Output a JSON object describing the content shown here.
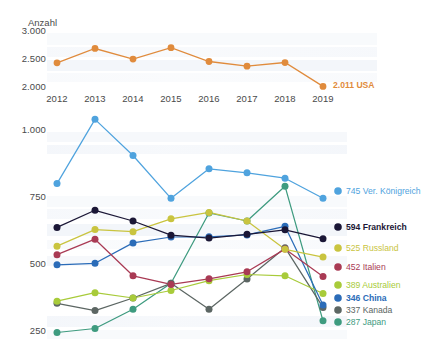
{
  "chart_data": {
    "type": "line",
    "title": "",
    "xlabel": "",
    "ylabel": "Anzahl",
    "x": [
      "2012",
      "2013",
      "2014",
      "2015",
      "2016",
      "2017",
      "2018",
      "2019"
    ],
    "panels": [
      {
        "name": "usa-panel",
        "ylim": [
          2000,
          3000
        ],
        "yticks": [
          2000,
          2500,
          3000
        ],
        "ytick_labels": [
          "2.000",
          "2.500",
          "3.000"
        ],
        "grid": false,
        "series": [
          {
            "name": "USA",
            "color": "#E08B3C",
            "values": [
              2432,
              2688,
              2498,
              2702,
              2455,
              2372,
              2437,
              2011
            ],
            "end_label": "2.011 USA",
            "end_value": 2011,
            "bold": false
          }
        ]
      },
      {
        "name": "countries-panel",
        "ylim": [
          230,
          1075
        ],
        "yticks": [
          250,
          500,
          750,
          1000
        ],
        "ytick_labels": [
          "250",
          "500",
          "750",
          "1.000"
        ],
        "grid": false,
        "series": [
          {
            "name": "Ver. Königreich",
            "color": "#4FA3DE",
            "values": [
              800,
              1040,
              905,
              745,
              855,
              840,
              820,
              745
            ],
            "end_label": "745 Ver. Königreich",
            "end_value": 745,
            "bold": false
          },
          {
            "name": "Frankreich",
            "color": "#1B1736",
            "values": [
              636,
              700,
              660,
              607,
              596,
              610,
              627,
              594
            ],
            "end_label": "594 Frankreich",
            "end_value": 594,
            "bold": true
          },
          {
            "name": "Russland",
            "color": "#C9C43F",
            "values": [
              566,
              628,
              620,
              668,
              692,
              660,
              554,
              525
            ],
            "end_label": "525 Russland",
            "end_value": 525,
            "bold": false
          },
          {
            "name": "Italien",
            "color": "#A93A54",
            "values": [
              534,
              592,
              455,
              423,
              444,
              470,
              555,
              452
            ],
            "end_label": "452 Italien",
            "end_value": 452,
            "bold": false
          },
          {
            "name": "Australien",
            "color": "#A8CB3A",
            "values": [
              360,
              392,
              372,
              400,
              437,
              460,
              455,
              389
            ],
            "end_label": "389 Australien",
            "end_value": 389,
            "bold": false
          },
          {
            "name": "China",
            "color": "#2B6CB8",
            "values": [
              496,
              502,
              578,
              600,
              601,
              608,
              640,
              346
            ],
            "end_label": "346 China",
            "end_value": 346,
            "bold": true
          },
          {
            "name": "Kanada",
            "color": "#5C6663",
            "values": [
              352,
              325,
              372,
              427,
              330,
              443,
              560,
              337
            ],
            "end_label": "337 Kanada",
            "end_value": 337,
            "bold": false
          },
          {
            "name": "Japan",
            "color": "#3E9B7F",
            "values": [
              243,
              258,
              330,
              427,
              690,
              660,
              790,
              287
            ],
            "end_label": "287 Japan",
            "end_value": 287,
            "bold": false
          }
        ]
      }
    ]
  }
}
